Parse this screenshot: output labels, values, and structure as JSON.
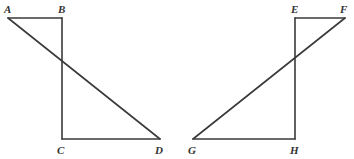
{
  "diagram": {
    "background_color": "#ffffff",
    "stroke_color": "#3a3a3a",
    "label_color": "#333333",
    "stroke_width": 1.6,
    "canvas": {
      "width": 354,
      "height": 159
    },
    "figures": [
      {
        "name": "left-figure",
        "vertices": [
          {
            "id": "A",
            "label": "A",
            "x": 8,
            "y": 18,
            "label_x": 4,
            "label_y": 13
          },
          {
            "id": "B",
            "label": "B",
            "x": 62,
            "y": 18,
            "label_x": 58,
            "label_y": 13
          },
          {
            "id": "C",
            "label": "C",
            "x": 62,
            "y": 139,
            "label_x": 57,
            "label_y": 154
          },
          {
            "id": "D",
            "label": "D",
            "x": 160,
            "y": 139,
            "label_x": 155,
            "label_y": 154
          }
        ],
        "segments": [
          {
            "id": "AB",
            "from": "A",
            "to": "B",
            "role": "top-side"
          },
          {
            "id": "BC",
            "from": "B",
            "to": "C",
            "role": "vertical-side"
          },
          {
            "id": "CD",
            "from": "C",
            "to": "D",
            "role": "bottom-side"
          },
          {
            "id": "AD",
            "from": "A",
            "to": "D",
            "role": "diagonal"
          }
        ],
        "intersection": {
          "x": 62,
          "y": 60,
          "of": [
            "AD",
            "BC"
          ]
        }
      },
      {
        "name": "right-figure",
        "vertices": [
          {
            "id": "E",
            "label": "E",
            "x": 295,
            "y": 18,
            "label_x": 291,
            "label_y": 13
          },
          {
            "id": "F",
            "label": "F",
            "x": 345,
            "y": 18,
            "label_x": 340,
            "label_y": 13
          },
          {
            "id": "G",
            "label": "G",
            "x": 193,
            "y": 139,
            "label_x": 188,
            "label_y": 154
          },
          {
            "id": "H",
            "label": "H",
            "x": 295,
            "y": 139,
            "label_x": 290,
            "label_y": 154
          }
        ],
        "segments": [
          {
            "id": "EF",
            "from": "E",
            "to": "F",
            "role": "top-side"
          },
          {
            "id": "EH",
            "from": "E",
            "to": "H",
            "role": "vertical-side"
          },
          {
            "id": "GH",
            "from": "G",
            "to": "H",
            "role": "bottom-side"
          },
          {
            "id": "GF",
            "from": "G",
            "to": "F",
            "role": "diagonal"
          }
        ],
        "intersection": {
          "x": 295,
          "y": 60,
          "of": [
            "GF",
            "EH"
          ]
        }
      }
    ]
  }
}
